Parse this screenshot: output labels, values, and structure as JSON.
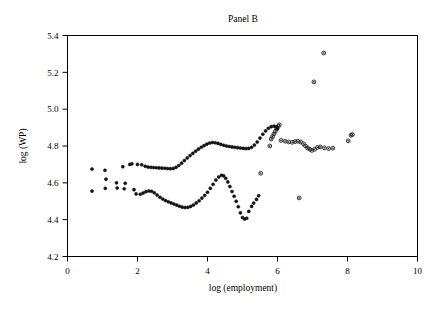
{
  "chart_data": {
    "type": "scatter",
    "title": "Panel B",
    "xlabel": "log (employment)",
    "ylabel": "log (WP)",
    "xlim": [
      0,
      10
    ],
    "ylim": [
      4.2,
      5.4
    ],
    "xticks": [
      0,
      2,
      4,
      6,
      8,
      10
    ],
    "yticks": [
      4.2,
      4.4,
      4.6,
      4.8,
      5.0,
      5.2,
      5.4
    ],
    "xtick_labels": [
      "0",
      "2",
      "4",
      "6",
      "8",
      "10"
    ],
    "ytick_labels": [
      "4.2",
      "4.4",
      "4.6",
      "4.8",
      "5.0",
      "5.2",
      "5.4"
    ],
    "grid": false,
    "legend": "none",
    "marker": "open-circle",
    "marker_color": "#111111",
    "series": [
      {
        "name": "upper-band",
        "points": [
          [
            0.7,
            4.675
          ],
          [
            1.07,
            4.668
          ],
          [
            1.1,
            4.62
          ],
          [
            1.4,
            4.6
          ],
          [
            1.58,
            4.688
          ],
          [
            1.65,
            4.598
          ],
          [
            1.78,
            4.7
          ],
          [
            1.84,
            4.703
          ],
          [
            2.0,
            4.7
          ],
          [
            2.12,
            4.698
          ],
          [
            2.22,
            4.69
          ],
          [
            2.3,
            4.686
          ],
          [
            2.38,
            4.684
          ],
          [
            2.46,
            4.683
          ],
          [
            2.54,
            4.682
          ],
          [
            2.62,
            4.681
          ],
          [
            2.7,
            4.68
          ],
          [
            2.78,
            4.679
          ],
          [
            2.86,
            4.678
          ],
          [
            2.94,
            4.677
          ],
          [
            3.02,
            4.678
          ],
          [
            3.1,
            4.684
          ],
          [
            3.18,
            4.694
          ],
          [
            3.26,
            4.707
          ],
          [
            3.34,
            4.721
          ],
          [
            3.42,
            4.735
          ],
          [
            3.5,
            4.748
          ],
          [
            3.58,
            4.76
          ],
          [
            3.66,
            4.772
          ],
          [
            3.74,
            4.783
          ],
          [
            3.82,
            4.793
          ],
          [
            3.9,
            4.802
          ],
          [
            3.98,
            4.81
          ],
          [
            4.06,
            4.816
          ],
          [
            4.14,
            4.819
          ],
          [
            4.22,
            4.818
          ],
          [
            4.3,
            4.814
          ],
          [
            4.38,
            4.809
          ],
          [
            4.46,
            4.804
          ],
          [
            4.54,
            4.8
          ],
          [
            4.62,
            4.797
          ],
          [
            4.7,
            4.795
          ],
          [
            4.78,
            4.793
          ],
          [
            4.86,
            4.791
          ],
          [
            4.94,
            4.789
          ],
          [
            5.02,
            4.787
          ],
          [
            5.1,
            4.786
          ],
          [
            5.18,
            4.787
          ],
          [
            5.26,
            4.793
          ],
          [
            5.34,
            4.805
          ],
          [
            5.42,
            4.822
          ],
          [
            5.5,
            4.843
          ],
          [
            5.58,
            4.864
          ],
          [
            5.66,
            4.882
          ],
          [
            5.74,
            4.896
          ],
          [
            5.82,
            4.905
          ],
          [
            5.9,
            4.908
          ],
          [
            5.96,
            4.903
          ],
          [
            6.0,
            4.893
          ]
        ]
      },
      {
        "name": "lower-band",
        "points": [
          [
            0.7,
            4.555
          ],
          [
            1.08,
            4.57
          ],
          [
            1.42,
            4.572
          ],
          [
            1.62,
            4.568
          ],
          [
            1.9,
            4.563
          ],
          [
            1.96,
            4.54
          ],
          [
            2.08,
            4.538
          ],
          [
            2.16,
            4.545
          ],
          [
            2.24,
            4.552
          ],
          [
            2.32,
            4.556
          ],
          [
            2.4,
            4.554
          ],
          [
            2.48,
            4.546
          ],
          [
            2.56,
            4.534
          ],
          [
            2.64,
            4.522
          ],
          [
            2.72,
            4.512
          ],
          [
            2.8,
            4.504
          ],
          [
            2.88,
            4.497
          ],
          [
            2.96,
            4.491
          ],
          [
            3.04,
            4.485
          ],
          [
            3.12,
            4.479
          ],
          [
            3.2,
            4.473
          ],
          [
            3.28,
            4.468
          ],
          [
            3.36,
            4.466
          ],
          [
            3.44,
            4.467
          ],
          [
            3.52,
            4.472
          ],
          [
            3.6,
            4.48
          ],
          [
            3.68,
            4.491
          ],
          [
            3.76,
            4.503
          ],
          [
            3.84,
            4.517
          ],
          [
            3.92,
            4.532
          ],
          [
            4.0,
            4.549
          ],
          [
            4.08,
            4.57
          ],
          [
            4.16,
            4.592
          ],
          [
            4.24,
            4.615
          ],
          [
            4.32,
            4.632
          ],
          [
            4.4,
            4.641
          ],
          [
            4.46,
            4.638
          ],
          [
            4.52,
            4.625
          ],
          [
            4.58,
            4.605
          ],
          [
            4.64,
            4.58
          ],
          [
            4.7,
            4.553
          ],
          [
            4.76,
            4.527
          ],
          [
            4.82,
            4.5
          ],
          [
            4.88,
            4.47
          ],
          [
            4.94,
            4.437
          ],
          [
            5.0,
            4.412
          ],
          [
            5.06,
            4.403
          ],
          [
            5.12,
            4.408
          ],
          [
            5.18,
            4.445
          ],
          [
            5.26,
            4.472
          ],
          [
            5.32,
            4.49
          ],
          [
            5.4,
            4.51
          ],
          [
            5.46,
            4.53
          ]
        ]
      },
      {
        "name": "upper-steep-segment",
        "points": [
          [
            5.82,
            4.838
          ],
          [
            5.86,
            4.852
          ],
          [
            5.9,
            4.866
          ],
          [
            5.94,
            4.88
          ],
          [
            5.98,
            4.894
          ],
          [
            6.02,
            4.906
          ],
          [
            6.05,
            4.915
          ]
        ]
      },
      {
        "name": "right-tail",
        "points": [
          [
            5.52,
            4.652
          ],
          [
            5.78,
            4.8
          ],
          [
            6.1,
            4.83
          ],
          [
            6.22,
            4.826
          ],
          [
            6.32,
            4.822
          ],
          [
            6.42,
            4.82
          ],
          [
            6.5,
            4.824
          ],
          [
            6.58,
            4.826
          ],
          [
            6.66,
            4.822
          ],
          [
            6.74,
            4.812
          ],
          [
            6.8,
            4.8
          ],
          [
            6.86,
            4.79
          ],
          [
            6.92,
            4.782
          ],
          [
            6.98,
            4.776
          ],
          [
            7.06,
            4.782
          ],
          [
            7.14,
            4.792
          ],
          [
            7.22,
            4.795
          ],
          [
            7.34,
            4.79
          ],
          [
            7.46,
            4.786
          ],
          [
            7.58,
            4.788
          ],
          [
            8.02,
            4.828
          ],
          [
            8.1,
            4.858
          ],
          [
            8.14,
            4.862
          ]
        ]
      },
      {
        "name": "outliers",
        "points": [
          [
            7.32,
            5.305
          ],
          [
            7.04,
            5.148
          ],
          [
            6.62,
            4.518
          ]
        ]
      }
    ]
  },
  "figure": {
    "background_color": "#ffffff",
    "frame_color": "#000000",
    "marker_stroke_color": "#111111"
  }
}
